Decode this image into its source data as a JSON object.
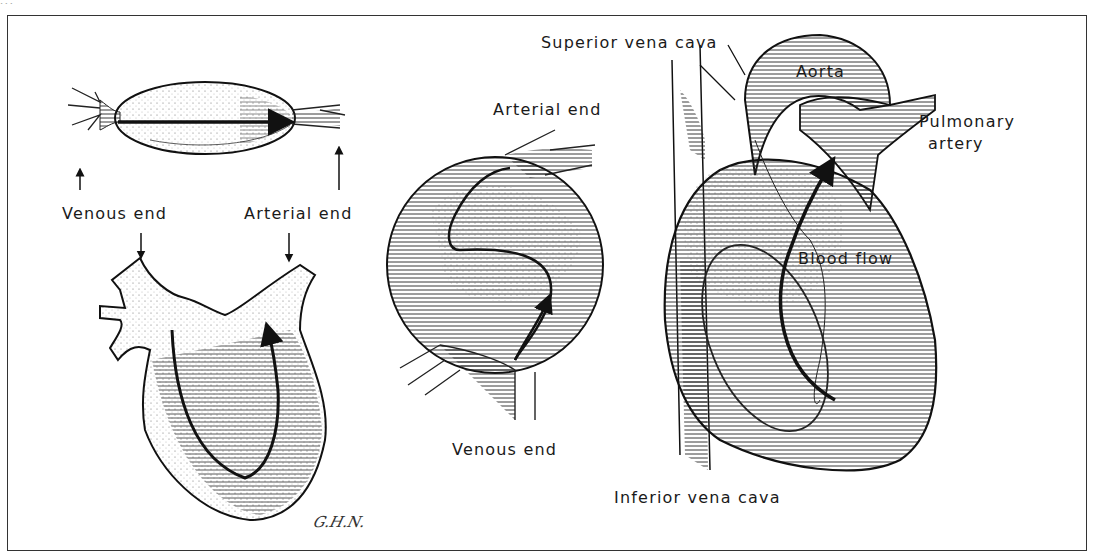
{
  "figure": {
    "header_fragment": "...",
    "panels": [
      {
        "id": "straight-tube",
        "labels": {
          "venous_end": "Venous end",
          "arterial_end": "Arterial end"
        }
      },
      {
        "id": "looped-tube",
        "labels": {
          "arterial_end": "Arterial end",
          "venous_end": "Venous end"
        }
      },
      {
        "id": "mature-heart",
        "labels": {
          "superior_vena_cava": "Superior vena cava",
          "aorta": "Aorta",
          "pulmonary_artery_line1": "Pulmonary",
          "pulmonary_artery_line2": "artery",
          "blood_flow": "Blood flow",
          "inferior_vena_cava": "Inferior vena cava"
        }
      }
    ],
    "signature": "G.H.N.",
    "colors": {
      "ink": "#1a1a1a",
      "background": "#ffffff",
      "frame": "#333333"
    }
  }
}
